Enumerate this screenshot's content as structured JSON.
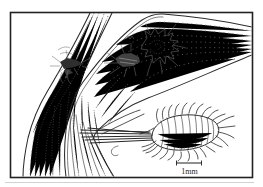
{
  "figure": {
    "scale_bar_label": "1mm",
    "colors": {
      "ink": "#2a2a2a",
      "stipple": "#6a6a6a",
      "paper": "#ffffff"
    },
    "parts": [
      "grass-blades",
      "leaf-sheath",
      "mealybug-colony-on-left-blade",
      "mealybug-colony-with-wax-on-right-leaf",
      "enlarged-mealybug",
      "scale-bar"
    ]
  }
}
